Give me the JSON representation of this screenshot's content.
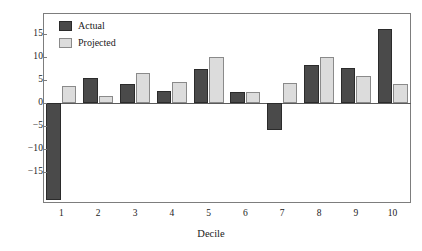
{
  "chart_data": {
    "type": "bar",
    "title": "",
    "subtitle": "",
    "xlabel": "Decile",
    "ylabel": "",
    "categories": [
      "1",
      "2",
      "3",
      "4",
      "5",
      "6",
      "7",
      "8",
      "9",
      "10"
    ],
    "series": [
      {
        "name": "Actual",
        "color": "#4a4a4a",
        "values": [
          -21.0,
          5.4,
          4.2,
          2.7,
          7.3,
          2.4,
          -5.8,
          8.3,
          7.6,
          16.1
        ]
      },
      {
        "name": "Projected",
        "color": "#dcdcdc",
        "values": [
          3.7,
          1.5,
          6.6,
          4.5,
          10.0,
          2.5,
          4.3,
          9.9,
          5.9,
          4.1
        ]
      }
    ],
    "ylim": [
      -21.8,
      19.5
    ],
    "yticks": [
      15,
      10,
      5,
      0,
      -5,
      -10,
      -15
    ],
    "ytick_labels": [
      "15",
      "10",
      "5",
      "0",
      "−5",
      "−10",
      "−15"
    ],
    "grid": false,
    "legend_position": "top-left",
    "zero_line": true
  },
  "legend": {
    "items": [
      {
        "label": "Actual",
        "swatch": "actual"
      },
      {
        "label": "Projected",
        "swatch": "projected"
      }
    ]
  },
  "axes": {
    "x_title": "Decile"
  }
}
